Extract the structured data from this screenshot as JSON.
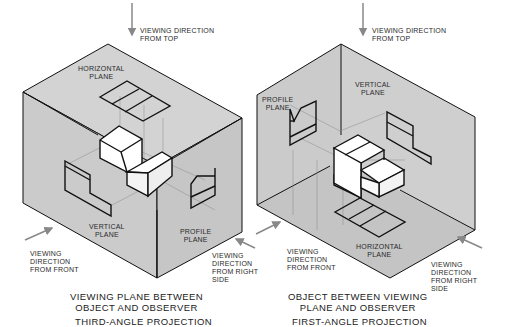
{
  "colors": {
    "plane_fill": "#cfcfcf",
    "plane_fill_dark": "#c4c4c4",
    "object_fill": "#ffffff",
    "line": "#111111",
    "projector": "#8a8a8a",
    "arrow": "#888888"
  },
  "third_angle": {
    "top_direction": "VIEWING DIRECTION\nFROM TOP",
    "horizontal_plane": "HORIZONTAL\nPLANE",
    "vertical_plane": "VERTICAL\nPLANE",
    "profile_plane": "PROFILE\nPLANE",
    "front_direction": "VIEWING\nDIRECTION\nFROM FRONT",
    "right_direction": "VIEWING\nDIRECTION\nFROM RIGHT\nSIDE",
    "caption": "VIEWING PLANE BETWEEN\nOBJECT AND OBSERVER",
    "title": "THIRD-ANGLE PROJECTION"
  },
  "first_angle": {
    "top_direction": "VIEWING DIRECTION\nFROM TOP",
    "vertical_plane": "VERTICAL\nPLANE",
    "profile_plane": "PROFILE\nPLANE",
    "horizontal_plane": "HORIZONTAL\nPLANE",
    "front_direction": "VIEWING\nDIRECTION\nFROM FRONT",
    "right_direction": "VIEWING\nDIRECTION\nFROM RIGHT\nSIDE",
    "caption": "OBJECT BETWEEN VIEWING\nPLANE AND OBSERVER",
    "title": "FIRST-ANGLE PROJECTION"
  }
}
